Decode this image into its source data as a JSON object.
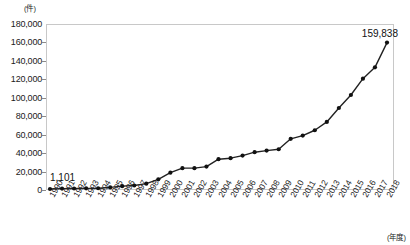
{
  "chart_data": {
    "type": "line",
    "title": "",
    "xlabel": "(年度)",
    "ylabel": "(件)",
    "unit_top": "(件)",
    "unit_bottom": "(年度)",
    "ylim": [
      0,
      180000
    ],
    "ytick_values": [
      0,
      20000,
      40000,
      60000,
      80000,
      100000,
      120000,
      140000,
      160000,
      180000
    ],
    "ytick_labels": [
      "0",
      "20,000",
      "40,000",
      "60,000",
      "80,000",
      "100,000",
      "120,000",
      "140,000",
      "160,000",
      "180,000"
    ],
    "grid": false,
    "legend": "none",
    "marker": "filled-circle",
    "line_color": "#222222",
    "marker_color": "#111111",
    "border_color": "#c8c8c8",
    "categories": [
      "1990",
      "1991",
      "1992",
      "1993",
      "1994",
      "1995",
      "1996",
      "1997",
      "1998",
      "1999",
      "2000",
      "2001",
      "2002",
      "2003",
      "2004",
      "2005",
      "2006",
      "2007",
      "2008",
      "2009",
      "2010",
      "2011",
      "2012",
      "2013",
      "2014",
      "2015",
      "2016",
      "2017",
      "2018"
    ],
    "values": [
      1101,
      1500,
      1600,
      1800,
      1900,
      2800,
      4200,
      4900,
      6900,
      11600,
      18800,
      23700,
      23700,
      25400,
      33400,
      34500,
      37300,
      41000,
      42700,
      44200,
      55500,
      59000,
      64800,
      73800,
      88900,
      103000,
      120700,
      133000,
      159838
    ],
    "annotations": [
      {
        "name": "first-value-label",
        "label": "1,101",
        "category": "1990",
        "value": 1101
      },
      {
        "name": "last-value-label",
        "label": "159,838",
        "category": "2018",
        "value": 159838
      }
    ]
  }
}
